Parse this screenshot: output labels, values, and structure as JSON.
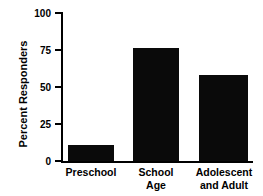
{
  "chart_data": {
    "type": "bar",
    "title": "",
    "subtitle": "",
    "xlabel": "",
    "ylabel": "Percent Responders",
    "categories": [
      "Preschool",
      "School Age",
      "Adolescent and Adult"
    ],
    "category_lines": [
      [
        "Preschool"
      ],
      [
        "School",
        "Age"
      ],
      [
        "Adolescent",
        "and Adult"
      ]
    ],
    "values": [
      11,
      76,
      58
    ],
    "ylim": [
      0,
      100
    ],
    "yticks": [
      0,
      25,
      50,
      75,
      100
    ],
    "ytick_labels": [
      "0",
      "25",
      "50",
      "75",
      "100"
    ],
    "grid": false,
    "legend": null,
    "bar_color": "#0a0a0a",
    "axis_color": "#000000",
    "background": "#ffffff"
  }
}
